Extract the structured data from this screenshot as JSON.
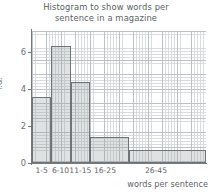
{
  "chart_data": {
    "type": "bar",
    "title": "Histogram to show words per sentence in a magazine",
    "title_line1": "Histogram to show words per",
    "title_line2": "sentence in a magazine",
    "xlabel": "words per sentence",
    "ylabel": "f.d.",
    "categories": [
      "1-5",
      "6-10",
      "11-15",
      "16-25",
      "26-45"
    ],
    "values": [
      3.6,
      6.4,
      4.4,
      1.4,
      0.7
    ],
    "bin_edges": [
      1,
      6,
      11,
      16,
      26,
      46
    ],
    "bin_widths": [
      5,
      5,
      5,
      10,
      20
    ],
    "frequencies": [
      18,
      32,
      22,
      14,
      14
    ],
    "ylim": [
      0,
      7.2
    ],
    "xlim": [
      1,
      46
    ],
    "yticks": [
      "0",
      "2",
      "4",
      "6"
    ],
    "ytick_values": [
      0,
      2,
      4,
      6
    ],
    "grid": true,
    "grid_minor": true,
    "legend": "none",
    "colors": {
      "bar_fill": "#969a9e",
      "bar_edge": "#6e7478",
      "grid_minor": "#d9dde0",
      "grid_major": "#bcc2c6",
      "axis": "#73797d",
      "text": "#5f6468",
      "background": "#ffffff"
    }
  }
}
